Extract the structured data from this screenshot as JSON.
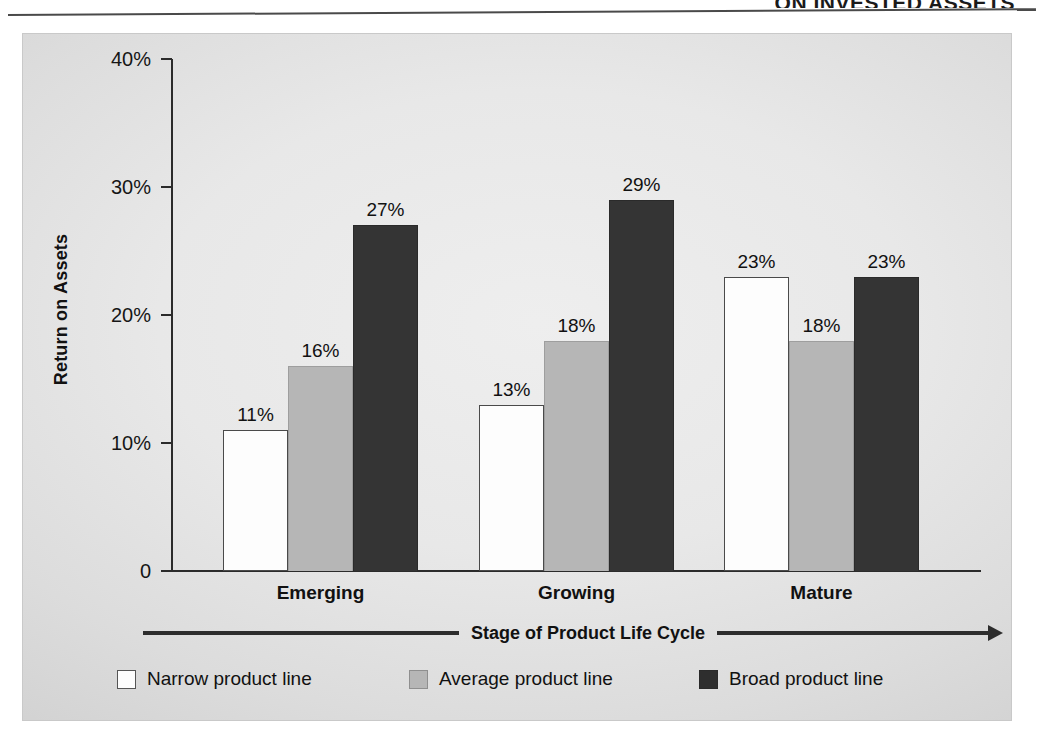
{
  "header": {
    "title": "ON INVESTED ASSETS"
  },
  "chart_data": {
    "type": "bar",
    "title": "",
    "xlabel": "Stage of Product Life Cycle",
    "ylabel": "Return on Assets",
    "categories": [
      "Emerging",
      "Growing",
      "Mature"
    ],
    "ylim": [
      0,
      40
    ],
    "yticks": [
      0,
      10,
      20,
      30,
      40
    ],
    "ytick_labels": [
      "0",
      "10%",
      "20%",
      "30%",
      "40%"
    ],
    "grid": false,
    "legend_position": "bottom",
    "series": [
      {
        "name": "Narrow product line",
        "color": "#fdfdfd",
        "values": [
          11,
          13,
          23
        ],
        "labels": [
          "11%",
          "13%",
          "23%"
        ]
      },
      {
        "name": "Average product line",
        "color": "#b6b6b6",
        "values": [
          16,
          18,
          18
        ],
        "labels": [
          "16%",
          "18%",
          "18%"
        ]
      },
      {
        "name": "Broad product line",
        "color": "#2e2e2e",
        "values": [
          27,
          29,
          23
        ],
        "labels": [
          "27%",
          "29%",
          "23%"
        ]
      }
    ]
  },
  "axis_arrow": {
    "left_arrow": "line",
    "right_arrow": "arrowhead-right"
  }
}
